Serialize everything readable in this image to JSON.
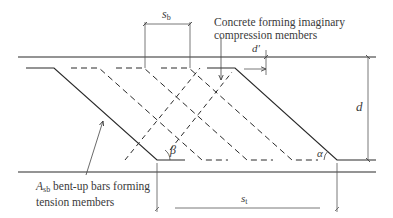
{
  "diagram": {
    "type": "truss analogy of bent-up bar shear reinforcement",
    "colors": {
      "line": "#2a2a2a",
      "dimension": "#555555",
      "text": "#3a3a3a",
      "background": "#ffffff"
    },
    "labels": {
      "sb_main": "s",
      "sb_sub": "b",
      "st_main": "s",
      "st_sub": "t",
      "d": "d",
      "d_prime": "d'",
      "alpha": "α",
      "beta": "β",
      "compression_line1": "Concrete forming imaginary",
      "compression_line2": "compression members",
      "tension_main": "A",
      "tension_sub": "sb",
      "tension_line1_rest": " bent-up bars forming",
      "tension_line2": "tension members"
    },
    "geometry": {
      "top_face_y": 57,
      "bottom_face_y": 172,
      "top_bar_level_y": 68,
      "bottom_bar_level_y": 160,
      "bar_spacing_sb": 45,
      "bar_spacing_st": 180
    }
  }
}
